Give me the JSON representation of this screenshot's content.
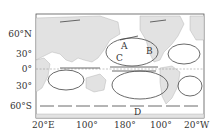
{
  "map": {
    "latitude_labels": [
      "60°N",
      "30°",
      "0°",
      "30°",
      "60°S"
    ],
    "longitude_labels": [
      "20°E",
      "100°",
      "180°",
      "100°",
      "20°W"
    ],
    "current_labels": [
      "A",
      "B",
      "C",
      "D"
    ]
  },
  "colors": {
    "land": "#e2e2e2",
    "ocean": "#ffffff",
    "arrows": "#444444",
    "frame": "#555555"
  }
}
